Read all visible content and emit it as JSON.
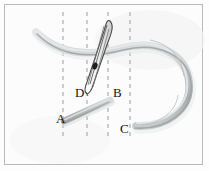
{
  "figure": {
    "caption": "",
    "background_color": "#fcfcfc",
    "frame_color": "#b9b9b9",
    "labels": [
      {
        "id": "A",
        "text": "A",
        "x": 56,
        "y": 112
      },
      {
        "id": "B",
        "text": "B",
        "x": 113,
        "y": 86
      },
      {
        "id": "C",
        "text": "C",
        "x": 120,
        "y": 122
      },
      {
        "id": "D",
        "text": "D",
        "x": 75,
        "y": 86
      }
    ],
    "dashed_lines": {
      "count": 4,
      "color": "#9a9aa4",
      "dash_pattern": "4 4",
      "x_positions": [
        63,
        87,
        108,
        130
      ],
      "y_top": 12,
      "y_bottom": 140
    },
    "objects": {
      "cord": {
        "name": "curved-cord",
        "color": "#b6b9ba",
        "highlight_color": "#d9dcdd",
        "description": "long flexible cord entering at upper left, crossing the frame and looping around to the right before returning to point C"
      },
      "needle": {
        "name": "sewing-needle",
        "color": "#6e6e6e",
        "fill_color": "#f2f2f2",
        "eye_color": "#2a2a2a",
        "description": "sewing needle angled from upper right down to lower left with a dark eye near its middle"
      },
      "bar": {
        "name": "short-bar-segment",
        "color": "#b0b3b4",
        "description": "short straight bar from point A up to the right toward point B"
      }
    }
  }
}
